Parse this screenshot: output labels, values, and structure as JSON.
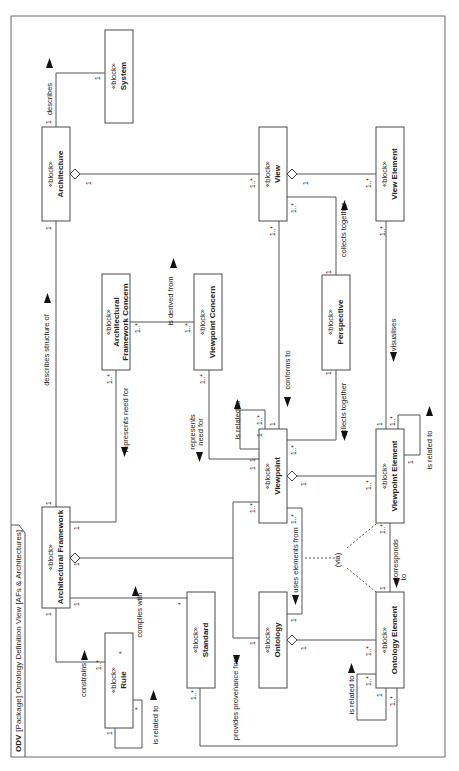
{
  "diagram": {
    "title_keyword": "ODV",
    "title_rest": "[Package] Ontology Definition View [AFs & Architectures]",
    "stereotype": "«block»",
    "blocks": {
      "system": "System",
      "architecture": "Architecture",
      "view": "View",
      "view_element": "View Element",
      "af_concern_line1": "Architectural",
      "af_concern_line2": "Framework Concern",
      "viewpoint_concern": "Viewpoint Concern",
      "perspective": "Perspective",
      "viewpoint": "Viewpoint",
      "viewpoint_element": "Viewpoint Element",
      "architectural_framework": "Architectural Framework",
      "rule": "Rule",
      "standard": "Standard",
      "ontology": "Ontology",
      "ontology_element": "Ontology Element"
    },
    "labels": {
      "describes": "describes",
      "describes_structure_of": "describes structure of",
      "is_derived_from": "is derived from",
      "represents_need_for": "represents need for",
      "represents": "represents",
      "need_for": "need for",
      "conforms_to": "conforms to",
      "collects_together": "collects together",
      "visualises": "visualises",
      "is_related_to": "is related to",
      "corresponds": "corresponds",
      "to": "to",
      "via": "(via)",
      "uses_elements_from": "uses elements from",
      "constrains": "constrains",
      "complies_with": "complies with",
      "provides_provenance_for": "provides provenance for"
    },
    "multiplicities": {
      "one": "1",
      "one_many": "1..*",
      "many": "*"
    }
  }
}
